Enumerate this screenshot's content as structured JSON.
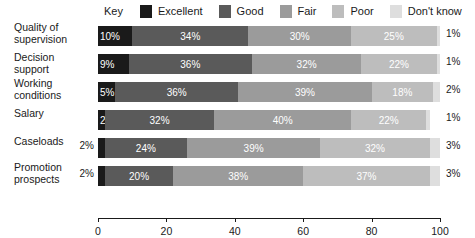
{
  "legend": {
    "key_label": "Key",
    "items": [
      {
        "label": "Excellent",
        "color": "#1a1a1a"
      },
      {
        "label": "Good",
        "color": "#5a5a5a"
      },
      {
        "label": "Fair",
        "color": "#9b9b9b"
      },
      {
        "label": "Poor",
        "color": "#bdbdbd"
      },
      {
        "label": "Don't know",
        "color": "#dedede"
      }
    ]
  },
  "chart_data": {
    "type": "bar",
    "orientation": "horizontal",
    "stacked": true,
    "title": "",
    "xlabel": "",
    "ylabel": "",
    "xlim": [
      0,
      100
    ],
    "xticks": [
      0,
      20,
      40,
      60,
      80,
      100
    ],
    "xtick_labels": [
      "0",
      "20",
      "40",
      "60",
      "80",
      "100"
    ],
    "grid": false,
    "legend_position": "top",
    "categories": [
      "Quality of supervision",
      "Decision support",
      "Working conditions",
      "Salary",
      "Caseloads",
      "Promotion prospects"
    ],
    "series": [
      {
        "name": "Excellent",
        "color": "#1a1a1a",
        "values": [
          10,
          9,
          5,
          2,
          2,
          2
        ]
      },
      {
        "name": "Good",
        "color": "#5a5a5a",
        "values": [
          34,
          36,
          36,
          32,
          24,
          20
        ]
      },
      {
        "name": "Fair",
        "color": "#9b9b9b",
        "values": [
          30,
          32,
          39,
          40,
          39,
          38
        ]
      },
      {
        "name": "Poor",
        "color": "#bdbdbd",
        "values": [
          25,
          22,
          18,
          22,
          32,
          37
        ]
      },
      {
        "name": "Don't know",
        "color": "#dedede",
        "values": [
          1,
          1,
          2,
          1,
          3,
          3
        ]
      }
    ]
  },
  "rows": [
    {
      "label_line1": "Quality of",
      "label_line2": "supervision",
      "outside_left": "",
      "outside_right": "1%",
      "segments": [
        {
          "label": "10%",
          "value": 10,
          "color": "#1a1a1a",
          "text": "light",
          "align": "start"
        },
        {
          "label": "34%",
          "value": 34,
          "color": "#5a5a5a",
          "text": "light",
          "align": "center"
        },
        {
          "label": "30%",
          "value": 30,
          "color": "#9b9b9b",
          "text": "light",
          "align": "center"
        },
        {
          "label": "25%",
          "value": 25,
          "color": "#bdbdbd",
          "text": "light",
          "align": "center"
        },
        {
          "label": "",
          "value": 1,
          "color": "#dedede",
          "text": "dark",
          "align": "center"
        }
      ]
    },
    {
      "label_line1": "Decision support",
      "label_line2": "",
      "outside_left": "",
      "outside_right": "1%",
      "segments": [
        {
          "label": "9%",
          "value": 9,
          "color": "#1a1a1a",
          "text": "light",
          "align": "start"
        },
        {
          "label": "36%",
          "value": 36,
          "color": "#5a5a5a",
          "text": "light",
          "align": "center"
        },
        {
          "label": "32%",
          "value": 32,
          "color": "#9b9b9b",
          "text": "light",
          "align": "center"
        },
        {
          "label": "22%",
          "value": 22,
          "color": "#bdbdbd",
          "text": "light",
          "align": "center"
        },
        {
          "label": "",
          "value": 1,
          "color": "#dedede",
          "text": "dark",
          "align": "center"
        }
      ]
    },
    {
      "label_line1": "Working",
      "label_line2": "conditions",
      "outside_left": "",
      "outside_right": "2%",
      "segments": [
        {
          "label": "5%",
          "value": 5,
          "color": "#1a1a1a",
          "text": "light",
          "align": "start"
        },
        {
          "label": "36%",
          "value": 36,
          "color": "#5a5a5a",
          "text": "light",
          "align": "center"
        },
        {
          "label": "39%",
          "value": 39,
          "color": "#9b9b9b",
          "text": "light",
          "align": "center"
        },
        {
          "label": "18%",
          "value": 18,
          "color": "#bdbdbd",
          "text": "light",
          "align": "center"
        },
        {
          "label": "",
          "value": 2,
          "color": "#dedede",
          "text": "dark",
          "align": "center"
        }
      ]
    },
    {
      "label_line1": "Salary",
      "label_line2": "",
      "outside_left": "",
      "outside_right": "1%",
      "segments": [
        {
          "label": "2%",
          "value": 2,
          "color": "#1a1a1a",
          "text": "light",
          "align": "start"
        },
        {
          "label": "32%",
          "value": 32,
          "color": "#5a5a5a",
          "text": "light",
          "align": "center"
        },
        {
          "label": "40%",
          "value": 40,
          "color": "#9b9b9b",
          "text": "light",
          "align": "center"
        },
        {
          "label": "22%",
          "value": 22,
          "color": "#bdbdbd",
          "text": "light",
          "align": "center"
        },
        {
          "label": "",
          "value": 1,
          "color": "#dedede",
          "text": "dark",
          "align": "center"
        }
      ]
    },
    {
      "label_line1": "Caseloads",
      "label_line2": "",
      "outside_left": "2%",
      "outside_right": "3%",
      "segments": [
        {
          "label": "",
          "value": 2,
          "color": "#1a1a1a",
          "text": "light",
          "align": "center"
        },
        {
          "label": "24%",
          "value": 24,
          "color": "#5a5a5a",
          "text": "light",
          "align": "center"
        },
        {
          "label": "39%",
          "value": 39,
          "color": "#9b9b9b",
          "text": "light",
          "align": "center"
        },
        {
          "label": "32%",
          "value": 32,
          "color": "#bdbdbd",
          "text": "light",
          "align": "center"
        },
        {
          "label": "",
          "value": 3,
          "color": "#dedede",
          "text": "dark",
          "align": "center"
        }
      ]
    },
    {
      "label_line1": "Promotion",
      "label_line2": "prospects",
      "outside_left": "2%",
      "outside_right": "3%",
      "segments": [
        {
          "label": "",
          "value": 2,
          "color": "#1a1a1a",
          "text": "light",
          "align": "center"
        },
        {
          "label": "20%",
          "value": 20,
          "color": "#5a5a5a",
          "text": "light",
          "align": "center"
        },
        {
          "label": "38%",
          "value": 38,
          "color": "#9b9b9b",
          "text": "light",
          "align": "center"
        },
        {
          "label": "37%",
          "value": 37,
          "color": "#bdbdbd",
          "text": "light",
          "align": "center"
        },
        {
          "label": "",
          "value": 3,
          "color": "#dedede",
          "text": "dark",
          "align": "center"
        }
      ]
    }
  ],
  "axis": {
    "ticks": [
      "0",
      "20",
      "40",
      "60",
      "80",
      "100"
    ]
  }
}
